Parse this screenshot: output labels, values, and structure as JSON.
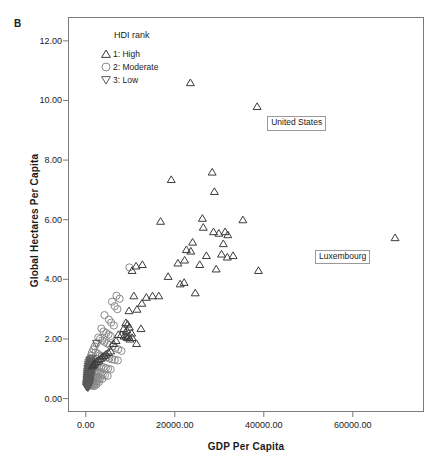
{
  "figure": {
    "panel_letter": "B"
  },
  "chart_data": {
    "type": "scatter",
    "title": "",
    "xlabel": "GDP Per Capita",
    "ylabel": "Global Hectares Per Capita",
    "xlim": [
      -4000,
      76000
    ],
    "ylim": [
      -0.45,
      12.8
    ],
    "xticks": [
      0,
      20000,
      40000,
      60000
    ],
    "xtick_labels": [
      "0.00",
      "20000.00",
      "40000.00",
      "60000.00"
    ],
    "yticks": [
      0,
      2,
      4,
      6,
      8,
      10,
      12
    ],
    "ytick_labels": [
      "0.00",
      "2.00",
      "4.00",
      "6.00",
      "8.00",
      "10.00",
      "12.00"
    ],
    "grid": false,
    "legend": {
      "title": "HDI rank",
      "position": "inside-top-left",
      "entries": [
        {
          "key": "1",
          "label": "1: High",
          "marker": "triangle-up",
          "color": "#3b3b3b"
        },
        {
          "key": "2",
          "label": "2: Moderate",
          "marker": "circle",
          "color": "#8a8a8a"
        },
        {
          "key": "3",
          "label": "3: Low",
          "marker": "triangle-down",
          "color": "#5a5a5a"
        }
      ]
    },
    "annotations": [
      {
        "label": "United States",
        "x": 38500,
        "y": 9.8,
        "box_dx": 10,
        "box_dy": 10
      },
      {
        "label": "Luxembourg",
        "x": 69500,
        "y": 5.4,
        "box_dx": -80,
        "box_dy": 12
      }
    ],
    "series": [
      {
        "name": "1: High",
        "marker": "triangle-up",
        "color": "#3b3b3b",
        "points": [
          [
            23500,
            10.6
          ],
          [
            38500,
            9.8
          ],
          [
            19200,
            7.35
          ],
          [
            28400,
            7.6
          ],
          [
            28900,
            6.95
          ],
          [
            16800,
            5.95
          ],
          [
            26200,
            6.05
          ],
          [
            26400,
            5.75
          ],
          [
            35300,
            6.0
          ],
          [
            69500,
            5.4
          ],
          [
            24000,
            5.25
          ],
          [
            28700,
            5.6
          ],
          [
            29900,
            5.55
          ],
          [
            31300,
            5.6
          ],
          [
            31900,
            5.5
          ],
          [
            30900,
            5.2
          ],
          [
            22600,
            5.0
          ],
          [
            23600,
            4.95
          ],
          [
            27100,
            4.8
          ],
          [
            30500,
            4.85
          ],
          [
            31800,
            4.75
          ],
          [
            33100,
            4.8
          ],
          [
            20700,
            4.55
          ],
          [
            22200,
            4.65
          ],
          [
            25600,
            4.5
          ],
          [
            29300,
            4.35
          ],
          [
            38800,
            4.3
          ],
          [
            12700,
            4.5
          ],
          [
            11300,
            4.45
          ],
          [
            10400,
            4.3
          ],
          [
            18500,
            4.1
          ],
          [
            21200,
            3.85
          ],
          [
            22100,
            3.9
          ],
          [
            24600,
            3.55
          ],
          [
            10800,
            3.45
          ],
          [
            13600,
            3.4
          ],
          [
            15000,
            3.45
          ],
          [
            16400,
            3.45
          ],
          [
            12600,
            3.2
          ],
          [
            11500,
            3.0
          ],
          [
            9700,
            2.95
          ],
          [
            9000,
            2.55
          ],
          [
            9400,
            2.5
          ],
          [
            8500,
            2.35
          ],
          [
            9200,
            2.3
          ],
          [
            9800,
            2.4
          ],
          [
            10300,
            2.2
          ],
          [
            12400,
            2.35
          ],
          [
            8000,
            2.15
          ],
          [
            8600,
            2.1
          ],
          [
            9000,
            2.1
          ],
          [
            9300,
            2.05
          ],
          [
            9600,
            2.1
          ],
          [
            9900,
            2.0
          ],
          [
            10400,
            2.05
          ],
          [
            11400,
            1.85
          ],
          [
            7300,
            2.15
          ],
          [
            6800,
            1.95
          ],
          [
            6200,
            1.85
          ],
          [
            5600,
            1.6
          ],
          [
            5100,
            1.55
          ],
          [
            4600,
            1.5
          ],
          [
            4200,
            1.45
          ],
          [
            3700,
            1.4
          ],
          [
            3300,
            1.35
          ],
          [
            2900,
            1.3
          ],
          [
            2500,
            1.25
          ],
          [
            2100,
            1.2
          ],
          [
            1800,
            1.15
          ],
          [
            1500,
            1.1
          ]
        ]
      },
      {
        "name": "2: Moderate",
        "marker": "circle",
        "color": "#8a8a8a",
        "points": [
          [
            9800,
            4.4
          ],
          [
            6900,
            3.45
          ],
          [
            7600,
            3.35
          ],
          [
            5900,
            3.25
          ],
          [
            6500,
            3.1
          ],
          [
            7100,
            3.0
          ],
          [
            4200,
            2.8
          ],
          [
            5200,
            2.65
          ],
          [
            5700,
            2.55
          ],
          [
            6300,
            2.45
          ],
          [
            3500,
            2.35
          ],
          [
            4000,
            2.25
          ],
          [
            4600,
            2.2
          ],
          [
            5100,
            2.15
          ],
          [
            5600,
            2.1
          ],
          [
            2800,
            2.05
          ],
          [
            3200,
            2.0
          ],
          [
            3700,
            1.95
          ],
          [
            4200,
            1.9
          ],
          [
            4800,
            1.85
          ],
          [
            5400,
            1.8
          ],
          [
            6000,
            1.75
          ],
          [
            6600,
            1.7
          ],
          [
            7300,
            1.65
          ],
          [
            8000,
            1.6
          ],
          [
            2400,
            1.85
          ],
          [
            2000,
            1.75
          ],
          [
            1700,
            1.65
          ],
          [
            2200,
            1.55
          ],
          [
            2700,
            1.5
          ],
          [
            3100,
            1.45
          ],
          [
            3600,
            1.42
          ],
          [
            4100,
            1.4
          ],
          [
            4700,
            1.38
          ],
          [
            5300,
            1.35
          ],
          [
            5900,
            1.32
          ],
          [
            6500,
            1.3
          ],
          [
            7200,
            1.28
          ],
          [
            1400,
            1.55
          ],
          [
            1200,
            1.45
          ],
          [
            1000,
            1.35
          ],
          [
            1300,
            1.25
          ],
          [
            1600,
            1.2
          ],
          [
            1900,
            1.18
          ],
          [
            2300,
            1.15
          ],
          [
            2700,
            1.12
          ],
          [
            3100,
            1.1
          ],
          [
            3500,
            1.08
          ],
          [
            4000,
            1.05
          ],
          [
            4500,
            1.02
          ],
          [
            5000,
            1.0
          ],
          [
            5600,
            0.98
          ],
          [
            800,
            1.15
          ],
          [
            600,
            1.05
          ],
          [
            900,
            0.98
          ],
          [
            1200,
            0.95
          ],
          [
            1500,
            0.92
          ],
          [
            1800,
            0.9
          ],
          [
            2100,
            0.88
          ],
          [
            2500,
            0.86
          ],
          [
            2900,
            0.84
          ],
          [
            3300,
            0.82
          ],
          [
            3800,
            0.8
          ],
          [
            4300,
            0.78
          ],
          [
            4900,
            0.76
          ],
          [
            500,
            0.9
          ],
          [
            700,
            0.85
          ],
          [
            1000,
            0.8
          ],
          [
            1300,
            0.78
          ],
          [
            1600,
            0.76
          ],
          [
            2000,
            0.74
          ],
          [
            2400,
            0.72
          ],
          [
            2800,
            0.7
          ],
          [
            3200,
            0.68
          ],
          [
            3700,
            0.66
          ],
          [
            400,
            0.72
          ],
          [
            600,
            0.68
          ],
          [
            850,
            0.65
          ],
          [
            1100,
            0.63
          ],
          [
            1400,
            0.61
          ],
          [
            1750,
            0.6
          ],
          [
            2100,
            0.58
          ],
          [
            2500,
            0.57
          ],
          [
            2950,
            0.56
          ],
          [
            300,
            0.58
          ],
          [
            500,
            0.55
          ],
          [
            750,
            0.53
          ],
          [
            1000,
            0.52
          ],
          [
            1300,
            0.5
          ],
          [
            1650,
            0.49
          ],
          [
            2000,
            0.48
          ],
          [
            2400,
            0.47
          ],
          [
            350,
            0.48
          ],
          [
            600,
            0.46
          ],
          [
            900,
            0.45
          ],
          [
            1200,
            0.44
          ],
          [
            1550,
            0.43
          ],
          [
            1900,
            0.42
          ]
        ]
      },
      {
        "name": "3: Low",
        "marker": "triangle-down",
        "color": "#5a5a5a",
        "points": [
          [
            2400,
            1.85
          ],
          [
            1400,
            1.35
          ],
          [
            1100,
            1.3
          ],
          [
            900,
            1.28
          ],
          [
            1300,
            1.25
          ],
          [
            700,
            1.22
          ],
          [
            1000,
            1.2
          ],
          [
            1250,
            1.18
          ],
          [
            600,
            1.15
          ],
          [
            850,
            1.13
          ],
          [
            1100,
            1.12
          ],
          [
            1400,
            1.1
          ],
          [
            500,
            1.08
          ],
          [
            750,
            1.06
          ],
          [
            1000,
            1.04
          ],
          [
            1250,
            1.02
          ],
          [
            1500,
            1.0
          ],
          [
            420,
            1.0
          ],
          [
            650,
            0.98
          ],
          [
            880,
            0.96
          ],
          [
            1120,
            0.94
          ],
          [
            1350,
            0.92
          ],
          [
            380,
            0.92
          ],
          [
            580,
            0.9
          ],
          [
            800,
            0.88
          ],
          [
            1020,
            0.86
          ],
          [
            1250,
            0.84
          ],
          [
            330,
            0.85
          ],
          [
            520,
            0.83
          ],
          [
            720,
            0.81
          ],
          [
            930,
            0.79
          ],
          [
            1150,
            0.77
          ],
          [
            300,
            0.78
          ],
          [
            470,
            0.76
          ],
          [
            650,
            0.74
          ],
          [
            840,
            0.72
          ],
          [
            1040,
            0.7
          ],
          [
            270,
            0.71
          ],
          [
            430,
            0.69
          ],
          [
            600,
            0.67
          ],
          [
            780,
            0.65
          ],
          [
            960,
            0.63
          ],
          [
            250,
            0.64
          ],
          [
            400,
            0.62
          ],
          [
            560,
            0.6
          ],
          [
            720,
            0.58
          ],
          [
            900,
            0.57
          ],
          [
            230,
            0.58
          ],
          [
            370,
            0.56
          ],
          [
            520,
            0.54
          ],
          [
            680,
            0.53
          ],
          [
            850,
            0.52
          ],
          [
            210,
            0.52
          ],
          [
            340,
            0.5
          ],
          [
            480,
            0.49
          ],
          [
            630,
            0.48
          ],
          [
            790,
            0.47
          ],
          [
            190,
            0.47
          ],
          [
            310,
            0.46
          ],
          [
            440,
            0.45
          ],
          [
            580,
            0.44
          ],
          [
            730,
            0.43
          ],
          [
            170,
            0.43
          ],
          [
            280,
            0.42
          ],
          [
            400,
            0.41
          ],
          [
            530,
            0.4
          ],
          [
            160,
            0.39
          ],
          [
            260,
            0.38
          ],
          [
            370,
            0.37
          ],
          [
            490,
            0.36
          ]
        ]
      }
    ]
  }
}
